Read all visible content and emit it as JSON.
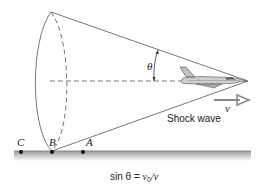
{
  "diagram": {
    "angle_label": "θ",
    "velocity_label": "v",
    "shock_wave_label": "Shock wave",
    "points": [
      {
        "id": "C",
        "label": "C"
      },
      {
        "id": "B",
        "label": "B"
      },
      {
        "id": "A",
        "label": "A"
      }
    ],
    "equation": {
      "prefix": "sin θ = ",
      "numerator": "v",
      "subscript": "0",
      "denominator": "/v"
    },
    "colors": {
      "line": "#555555",
      "ground_top": "#9a9a9a",
      "ground_bottom": "#e6e6e6",
      "arrow": "#888888"
    }
  }
}
